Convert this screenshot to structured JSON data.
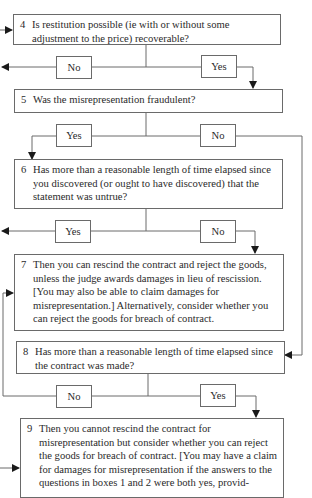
{
  "flowchart": {
    "boxes": [
      {
        "num": "4",
        "text": "Is restitution possible (ie with or without some adjustment to the price) recoverable?"
      },
      {
        "num": "5",
        "text": "Was the misrepresentation fraudulent?"
      },
      {
        "num": "6",
        "text": "Has more than a reasonable length of time elapsed since you discovered (or ought to have discovered) that the statement was untrue?"
      },
      {
        "num": "7",
        "text": "Then you can rescind the contract and reject the goods, unless the judge awards damages in lieu of rescission. [You may also be able to claim damages for misrepresentation.] Alternatively, consider whether you can reject the goods for breach of contract."
      },
      {
        "num": "8",
        "text": "Has more than a reasonable length of time elapsed since the contract was made?"
      },
      {
        "num": "9",
        "text": "Then you cannot rescind the contract for misrepresentation but consider whether you can reject the goods for breach of contract. [You may have a claim for damages for misrepresentation if the answers to the questions in boxes 1 and 2 were both yes, provid-"
      }
    ],
    "answers": {
      "q4_no": "No",
      "q4_yes": "Yes",
      "q5_yes": "Yes",
      "q5_no": "No",
      "q6_yes": "Yes",
      "q6_no": "No",
      "q8_no": "No",
      "q8_yes": "Yes"
    }
  }
}
